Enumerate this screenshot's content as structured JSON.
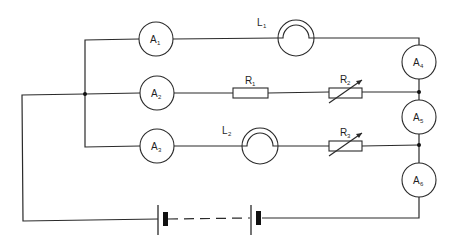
{
  "diagram": {
    "type": "electric-circuit",
    "colors": {
      "line": "#2a2a2a",
      "background": "#ffffff"
    },
    "ammeters": [
      {
        "id": "A1",
        "letter": "A",
        "sub": "1",
        "cx": 156,
        "cy": 39
      },
      {
        "id": "A2",
        "letter": "A",
        "sub": "2",
        "cx": 157,
        "cy": 93
      },
      {
        "id": "A3",
        "letter": "A",
        "sub": "3",
        "cx": 157,
        "cy": 146
      },
      {
        "id": "A4",
        "letter": "A",
        "sub": "4",
        "cx": 419,
        "cy": 62
      },
      {
        "id": "A5",
        "letter": "A",
        "sub": "5",
        "cx": 419,
        "cy": 117
      },
      {
        "id": "A6",
        "letter": "A",
        "sub": "6",
        "cx": 419,
        "cy": 180
      }
    ],
    "lamps": [
      {
        "id": "L1",
        "letter": "L",
        "sub": "1",
        "cx": 296,
        "cy": 38
      },
      {
        "id": "L2",
        "letter": "L",
        "sub": "2",
        "cx": 260,
        "cy": 146
      }
    ],
    "resistors": [
      {
        "id": "R1",
        "letter": "R",
        "sub": "1",
        "variable": false,
        "x": 233,
        "y": 93
      },
      {
        "id": "R2",
        "letter": "R",
        "sub": "2",
        "variable": true,
        "x": 329,
        "y": 93
      },
      {
        "id": "R3",
        "letter": "R",
        "sub": "3",
        "variable": true,
        "x": 329,
        "y": 146
      }
    ],
    "battery": {
      "cells_shown": 2,
      "dashed_link": true,
      "y": 218
    },
    "junctions": [
      {
        "x": 85,
        "y": 94
      },
      {
        "x": 419,
        "y": 92
      },
      {
        "x": 419,
        "y": 145
      }
    ]
  }
}
